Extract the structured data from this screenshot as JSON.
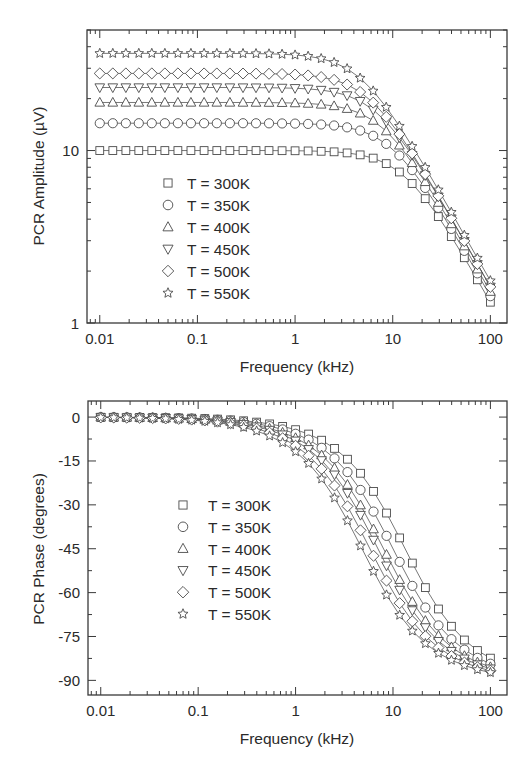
{
  "chart_data": [
    {
      "id": "amplitude",
      "type": "line",
      "title": "",
      "xlabel": "Frequency (kHz)",
      "ylabel": "PCR Amplitude (µV)",
      "xscale": "log",
      "yscale": "log",
      "xlim": [
        0.0074,
        148
      ],
      "ylim": [
        1,
        50
      ],
      "xticks": [
        0.01,
        0.1,
        1,
        10,
        100
      ],
      "xtick_labels": [
        "0.01",
        "0.1",
        "1",
        "10",
        "100"
      ],
      "yticks": [
        1,
        10
      ],
      "ytick_labels": [
        "1",
        "10"
      ],
      "grid": false,
      "legend_position": "center-left",
      "x": [
        0.01,
        0.0136,
        0.0185,
        0.0251,
        0.0341,
        0.0464,
        0.0631,
        0.0858,
        0.117,
        0.158,
        0.215,
        0.293,
        0.398,
        0.541,
        0.736,
        1,
        1.36,
        1.85,
        2.51,
        3.41,
        4.64,
        6.31,
        8.58,
        11.7,
        15.8,
        21.5,
        29.3,
        39.8,
        54.1,
        73.6,
        100
      ],
      "series": [
        {
          "name": "T = 300K",
          "marker": "square",
          "values": [
            10.0,
            10.0,
            10.0,
            10.0,
            10.0,
            10.0,
            10.0,
            10.0,
            10.0,
            10.0,
            10.0,
            10.0,
            10.0,
            10.0,
            9.98,
            9.97,
            9.95,
            9.9,
            9.83,
            9.69,
            9.44,
            9.04,
            8.4,
            7.51,
            6.44,
            5.26,
            4.14,
            3.17,
            2.39,
            1.78,
            1.32
          ]
        },
        {
          "name": "T = 350K",
          "marker": "circle",
          "values": [
            14.4,
            14.4,
            14.4,
            14.4,
            14.4,
            14.4,
            14.4,
            14.4,
            14.4,
            14.4,
            14.4,
            14.4,
            14.39,
            14.38,
            14.36,
            14.33,
            14.27,
            14.16,
            13.97,
            13.63,
            13.06,
            12.18,
            10.93,
            9.36,
            7.7,
            6.07,
            4.65,
            3.51,
            2.62,
            1.94,
            1.43
          ]
        },
        {
          "name": "T = 400K",
          "marker": "triangle-up",
          "values": [
            19.0,
            19.0,
            19.0,
            19.0,
            19.0,
            19.0,
            19.0,
            19.0,
            19.0,
            19.0,
            19.0,
            18.99,
            18.98,
            18.96,
            18.92,
            18.85,
            18.73,
            18.51,
            18.13,
            17.48,
            16.44,
            14.92,
            12.96,
            10.72,
            8.48,
            6.58,
            4.99,
            3.75,
            2.79,
            2.05,
            1.52
          ]
        },
        {
          "name": "T = 450K",
          "marker": "triangle-down",
          "values": [
            23.2,
            23.2,
            23.2,
            23.2,
            23.2,
            23.2,
            23.2,
            23.2,
            23.2,
            23.2,
            23.19,
            23.18,
            23.16,
            23.13,
            23.07,
            22.97,
            22.77,
            22.43,
            21.84,
            20.86,
            19.33,
            17.23,
            14.7,
            11.9,
            9.4,
            7.18,
            5.4,
            4.03,
            2.98,
            2.19,
            1.62
          ]
        },
        {
          "name": "T = 500K",
          "marker": "diamond",
          "values": [
            28.0,
            28.0,
            28.0,
            28.0,
            28.0,
            28.0,
            28.0,
            28.0,
            28.0,
            27.99,
            27.98,
            27.96,
            27.93,
            27.88,
            27.78,
            27.59,
            27.26,
            26.68,
            25.7,
            24.14,
            21.86,
            18.96,
            15.68,
            12.45,
            9.63,
            7.3,
            5.46,
            4.05,
            2.99,
            2.2,
            1.62
          ]
        },
        {
          "name": "T = 550K",
          "marker": "star",
          "values": [
            36.6,
            36.6,
            36.6,
            36.6,
            36.6,
            36.6,
            36.6,
            36.59,
            36.59,
            36.58,
            36.56,
            36.53,
            36.48,
            36.37,
            36.18,
            35.83,
            35.22,
            34.15,
            32.43,
            29.84,
            26.32,
            22.16,
            17.84,
            13.86,
            10.58,
            7.99,
            5.92,
            4.39,
            3.23,
            2.38,
            1.76
          ]
        }
      ]
    },
    {
      "id": "phase",
      "type": "line",
      "title": "",
      "xlabel": "Frequency (kHz)",
      "ylabel": "PCR Phase (degrees)",
      "xscale": "log",
      "yscale": "linear",
      "xlim": [
        0.0074,
        148
      ],
      "ylim": [
        -95,
        5.5
      ],
      "xticks": [
        0.01,
        0.1,
        1,
        10,
        100
      ],
      "xtick_labels": [
        "0.01",
        "0.1",
        "1",
        "10",
        "100"
      ],
      "yticks": [
        0,
        -15,
        -30,
        -45,
        -60,
        -75,
        -90
      ],
      "ytick_labels": [
        "0",
        "-15",
        "-30",
        "-45",
        "-60",
        "-75",
        "-90"
      ],
      "grid": false,
      "legend_position": "center-left",
      "x": [
        0.01,
        0.0136,
        0.0185,
        0.0251,
        0.0341,
        0.0464,
        0.0631,
        0.0858,
        0.117,
        0.158,
        0.215,
        0.293,
        0.398,
        0.541,
        0.736,
        1,
        1.36,
        1.85,
        2.51,
        3.41,
        4.64,
        6.31,
        8.58,
        11.7,
        15.8,
        21.5,
        29.3,
        39.8,
        54.1,
        73.6,
        100
      ],
      "series": [
        {
          "name": "T = 300K",
          "marker": "square",
          "values": [
            -0.04,
            -0.06,
            -0.08,
            -0.11,
            -0.15,
            -0.2,
            -0.27,
            -0.37,
            -0.5,
            -0.68,
            -0.93,
            -1.26,
            -1.71,
            -2.33,
            -3.17,
            -4.3,
            -5.8,
            -7.9,
            -10.7,
            -14.4,
            -19.2,
            -25.4,
            -32.8,
            -41.3,
            -49.9,
            -58.3,
            -65.6,
            -71.5,
            -76.2,
            -79.8,
            -82.4
          ]
        },
        {
          "name": "T = 350K",
          "marker": "circle",
          "values": [
            -0.06,
            -0.08,
            -0.11,
            -0.14,
            -0.2,
            -0.27,
            -0.36,
            -0.49,
            -0.67,
            -0.91,
            -1.23,
            -1.68,
            -2.28,
            -3.1,
            -4.21,
            -5.7,
            -7.7,
            -10.5,
            -14.1,
            -18.8,
            -24.9,
            -32.3,
            -40.6,
            -49.5,
            -57.7,
            -65.1,
            -71.2,
            -75.9,
            -79.5,
            -82.3,
            -84.3
          ]
        },
        {
          "name": "T = 400K",
          "marker": "triangle-up",
          "values": [
            -0.07,
            -0.1,
            -0.13,
            -0.18,
            -0.24,
            -0.33,
            -0.45,
            -0.61,
            -0.84,
            -1.13,
            -1.54,
            -2.1,
            -2.85,
            -3.87,
            -5.26,
            -7.1,
            -9.6,
            -13.0,
            -17.4,
            -23.1,
            -30.1,
            -38.3,
            -47.0,
            -55.6,
            -63.1,
            -69.6,
            -74.7,
            -78.6,
            -81.6,
            -83.8,
            -85.4
          ]
        },
        {
          "name": "T = 450K",
          "marker": "triangle-down",
          "values": [
            -0.08,
            -0.11,
            -0.15,
            -0.21,
            -0.28,
            -0.38,
            -0.52,
            -0.7,
            -0.96,
            -1.29,
            -1.76,
            -2.4,
            -3.25,
            -4.42,
            -6.0,
            -8.1,
            -11.0,
            -14.8,
            -19.7,
            -26.0,
            -33.5,
            -42.0,
            -50.8,
            -59.1,
            -66.1,
            -71.9,
            -76.6,
            -80.0,
            -82.6,
            -84.6,
            -86.0
          ]
        },
        {
          "name": "T = 500K",
          "marker": "diamond",
          "values": [
            -0.1,
            -0.13,
            -0.18,
            -0.25,
            -0.34,
            -0.46,
            -0.62,
            -0.85,
            -1.16,
            -1.56,
            -2.12,
            -2.89,
            -3.93,
            -5.33,
            -7.23,
            -9.8,
            -13.2,
            -17.7,
            -23.4,
            -30.5,
            -38.7,
            -47.4,
            -55.9,
            -63.6,
            -69.8,
            -74.9,
            -78.8,
            -81.7,
            -83.9,
            -85.5,
            -86.7
          ]
        },
        {
          "name": "T = 550K",
          "marker": "star",
          "values": [
            -0.12,
            -0.16,
            -0.22,
            -0.3,
            -0.41,
            -0.55,
            -0.75,
            -1.02,
            -1.4,
            -1.89,
            -2.56,
            -3.49,
            -4.74,
            -6.43,
            -8.72,
            -11.8,
            -15.8,
            -21.1,
            -27.6,
            -35.4,
            -44.0,
            -52.7,
            -60.8,
            -67.7,
            -73.1,
            -77.4,
            -80.7,
            -83.1,
            -84.9,
            -86.3,
            -87.3
          ]
        }
      ]
    }
  ],
  "figures": {
    "amplitude": {
      "ylabel": "PCR Amplitude (µV)",
      "xlabel": "Frequency (kHz)",
      "legend": [
        "T = 300K",
        "T = 350K",
        "T = 400K",
        "T = 450K",
        "T = 500K",
        "T = 550K"
      ]
    },
    "phase": {
      "ylabel": "PCR Phase (degrees)",
      "xlabel": "Frequency (kHz)",
      "legend": [
        "T = 300K",
        "T = 350K",
        "T = 400K",
        "T = 450K",
        "T = 500K",
        "T = 550K"
      ]
    }
  },
  "colors": {
    "axis": "#3a3a3a",
    "marker_stroke": "#4a4a4a",
    "curve": "#555555",
    "background": "#ffffff"
  }
}
